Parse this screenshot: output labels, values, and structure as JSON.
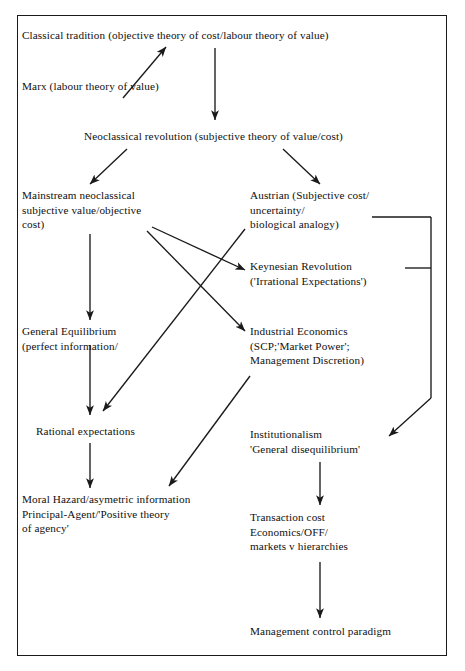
{
  "diagram": {
    "type": "flow-diagram",
    "border_color": "#1a1a1a",
    "line_color": "#1a1a1a",
    "text_color": "#101010",
    "nodes": [
      {
        "id": "classical-tradition",
        "lines": [
          "Classical tradition (objective theory of cost/labour theory of value)"
        ],
        "x": 22,
        "y": 28
      },
      {
        "id": "marx",
        "lines": [
          "Marx (labour theory of value)"
        ],
        "x": 22,
        "y": 79
      },
      {
        "id": "neoclassical-revolution",
        "lines": [
          "Neoclassical revolution (subjective theory of value/cost)"
        ],
        "x": 84,
        "y": 129
      },
      {
        "id": "mainstream-neoclassical",
        "lines": [
          "Mainstream neoclassical",
          "subjective value/objective",
          "cost)"
        ],
        "x": 22,
        "y": 188
      },
      {
        "id": "austrian",
        "lines": [
          "Austrian (Subjective cost/",
          "uncertainty/",
          "biological analogy)"
        ],
        "x": 250,
        "y": 188
      },
      {
        "id": "keynesian-revolution",
        "lines": [
          "Keynesian Revolution",
          "('Irrational Expectations')"
        ],
        "x": 250,
        "y": 259
      },
      {
        "id": "general-equilibrium",
        "lines": [
          "General Equilibrium",
          "(perfect information/"
        ],
        "x": 22,
        "y": 324
      },
      {
        "id": "industrial-economics",
        "lines": [
          "Industrial Economics",
          "(SCP;'Market Power';",
          "Management Discretion)"
        ],
        "x": 250,
        "y": 324
      },
      {
        "id": "rational-expectations",
        "lines": [
          "Rational expectations"
        ],
        "x": 36,
        "y": 424
      },
      {
        "id": "institutionalism",
        "lines": [
          "Institutionalism",
          "'General disequilibrium'"
        ],
        "x": 250,
        "y": 427
      },
      {
        "id": "moral-hazard",
        "lines": [
          "Moral Hazard/asymetric information",
          "Principal-Agent/'Positive theory",
          "of agency'"
        ],
        "x": 22,
        "y": 492
      },
      {
        "id": "transaction-cost",
        "lines": [
          "Transaction cost",
          "Economics/OFF/",
          "markets v hierarchies"
        ],
        "x": 250,
        "y": 510
      },
      {
        "id": "management-control",
        "lines": [
          "Management control paradigm"
        ],
        "x": 250,
        "y": 624
      }
    ],
    "edges": [
      {
        "id": "marx-to-classical",
        "from": "marx",
        "to": "classical-tradition",
        "arrow": true,
        "path": "M 123,98 L 166,47"
      },
      {
        "id": "classical-to-neoclassical",
        "from": "classical-tradition",
        "to": "neoclassical-revolution",
        "arrow": true,
        "path": "M 215,48 L 215,120"
      },
      {
        "id": "neoclassical-to-mainstream",
        "from": "neoclassical-revolution",
        "to": "mainstream-neoclassical",
        "arrow": true,
        "path": "M 127,149 L 90,184"
      },
      {
        "id": "neoclassical-to-austrian",
        "from": "neoclassical-revolution",
        "to": "austrian",
        "arrow": true,
        "path": "M 283,149 L 320,184"
      },
      {
        "id": "mainstream-to-general-equilibrium",
        "from": "mainstream-neoclassical",
        "to": "general-equilibrium",
        "arrow": true,
        "path": "M 90,234 L 90,320"
      },
      {
        "id": "mainstream-to-keynesian",
        "from": "mainstream-neoclassical",
        "to": "keynesian-revolution",
        "arrow": true,
        "path": "M 152,227 L 245,270"
      },
      {
        "id": "mainstream-to-industrial",
        "from": "mainstream-neoclassical",
        "to": "industrial-economics",
        "arrow": true,
        "path": "M 147,231 L 245,331"
      },
      {
        "id": "austrian-to-rational-expectations",
        "from": "austrian",
        "to": "rational-expectations",
        "arrow": true,
        "path": "M 245,229 L 103,411"
      },
      {
        "id": "general-equilibrium-to-rational",
        "from": "general-equilibrium",
        "to": "rational-expectations",
        "arrow": true,
        "path": "M 90,345 L 90,415"
      },
      {
        "id": "rational-to-moral-hazard",
        "from": "rational-expectations",
        "to": "moral-hazard",
        "arrow": true,
        "path": "M 90,443 L 90,488"
      },
      {
        "id": "industrial-to-moral-hazard",
        "from": "industrial-economics",
        "to": "moral-hazard",
        "arrow": true,
        "path": "M 250,376 L 169,486"
      },
      {
        "id": "bracket-austrian-stub",
        "from": "austrian",
        "to": "bracket",
        "arrow": false,
        "path": "M 372,217 L 431,217"
      },
      {
        "id": "bracket-keynesian-stub",
        "from": "keynesian-revolution",
        "to": "bracket",
        "arrow": false,
        "path": "M 405,268 L 431,268"
      },
      {
        "id": "bracket-spine",
        "from": "bracket",
        "to": "institutionalism",
        "arrow": false,
        "path": "M 431,217 L 431,398"
      },
      {
        "id": "bracket-to-institutionalism",
        "from": "bracket",
        "to": "institutionalism",
        "arrow": true,
        "path": "M 431,398 L 389,436"
      },
      {
        "id": "institutionalism-to-transaction-cost",
        "from": "institutionalism",
        "to": "transaction-cost",
        "arrow": true,
        "path": "M 320,462 L 320,505"
      },
      {
        "id": "transaction-cost-to-management",
        "from": "transaction-cost",
        "to": "management-control",
        "arrow": true,
        "path": "M 320,562 L 320,618"
      }
    ]
  }
}
